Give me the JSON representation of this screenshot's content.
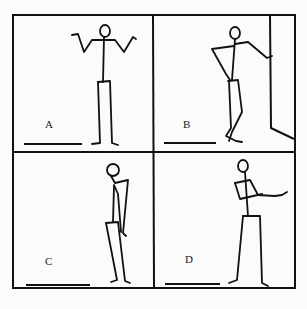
{
  "figure": {
    "panels": [
      {
        "id": "A",
        "label": "A",
        "pose": "standing, shrugging with both arms raised outward"
      },
      {
        "id": "B",
        "label": "B",
        "pose": "leaning against a wall, hand on hip, legs crossed"
      },
      {
        "id": "C",
        "label": "C",
        "pose": "slouched, head bowed, arms hanging"
      },
      {
        "id": "D",
        "label": "D",
        "pose": "standing with arms extended forward, feet apart"
      }
    ]
  }
}
